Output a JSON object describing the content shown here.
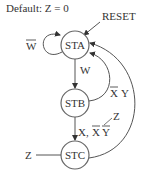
{
  "diagram": {
    "default_note": "Default: Z = 0",
    "reset_label": "RESET",
    "states": [
      {
        "name": "STA"
      },
      {
        "name": "STB"
      },
      {
        "name": "STC"
      }
    ],
    "transitions": {
      "sta_self": "W",
      "sta_to_stb": "W",
      "stb_to_sta_x": "X",
      "stb_to_sta_y": "Y",
      "stb_to_stc_x": "X,",
      "stb_to_stc_xbar": "X",
      "stb_to_stc_ybar": "Y",
      "stc_output_left": "Z",
      "stb_stc_output": "Z"
    },
    "colors": {
      "stroke": "#555555",
      "text": "#333333",
      "background": "#ffffff"
    }
  }
}
